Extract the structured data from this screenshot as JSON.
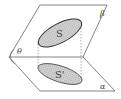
{
  "diagram": {
    "labels": {
      "upper_plane": "β",
      "lower_plane": "α",
      "angle": "θ",
      "region": "S",
      "projection": "S'"
    },
    "colors": {
      "line": "#555555",
      "ellipse_fill": "#c8c8c8",
      "ellipse_stroke": "#333333",
      "background": "#ffffff"
    }
  }
}
